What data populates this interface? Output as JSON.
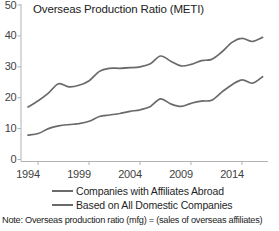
{
  "title": "Overseas Production Ratio (METI)",
  "note": "Note: Overseas production ratio (mfg) = (sales of overseas affiliates)",
  "legend": [
    {
      "label": "Companies with Affiliates Abroad",
      "color": "#6a6a6a"
    },
    {
      "label": "Based on All Domestic Companies",
      "color": "#6a6a6a"
    }
  ],
  "colors": {
    "axis": "#b3b3b3",
    "tick_label": "#3f3f3f",
    "title_text": "#212121",
    "line_gray": "#6a6a6a"
  },
  "chart_data": {
    "type": "line",
    "title": "Overseas Production Ratio (METI)",
    "xlabel": "",
    "ylabel": "",
    "x": [
      1994,
      1995,
      1996,
      1997,
      1998,
      1999,
      2000,
      2001,
      2002,
      2003,
      2004,
      2005,
      2006,
      2007,
      2008,
      2009,
      2010,
      2011,
      2012,
      2013,
      2014,
      2015,
      2016,
      2017
    ],
    "series": [
      {
        "name": "Companies with Affiliates Abroad",
        "color": "#6a6a6a",
        "values": [
          17.0,
          19.0,
          21.5,
          24.5,
          23.5,
          24.0,
          25.5,
          28.5,
          29.5,
          29.5,
          29.7,
          30.0,
          31.0,
          33.5,
          31.8,
          30.3,
          30.8,
          32.0,
          32.4,
          34.8,
          37.9,
          39.2,
          38.2,
          39.5
        ]
      },
      {
        "name": "Based on All Domestic Companies",
        "color": "#6a6a6a",
        "values": [
          7.9,
          8.4,
          10.0,
          10.9,
          11.3,
          11.6,
          12.4,
          13.9,
          14.4,
          14.9,
          15.6,
          16.1,
          17.2,
          19.6,
          18.0,
          17.2,
          18.2,
          18.9,
          19.2,
          21.8,
          24.2,
          25.8,
          24.7,
          26.8
        ]
      }
    ],
    "xticks": [
      1994,
      1999,
      2004,
      2009,
      2014
    ],
    "yticks": [
      0,
      10,
      20,
      30,
      40,
      50
    ],
    "xlim": [
      1994,
      2017
    ],
    "ylim": [
      0,
      50
    ],
    "grid": false,
    "smoothed_lines": true,
    "legend_position": "bottom-left"
  }
}
